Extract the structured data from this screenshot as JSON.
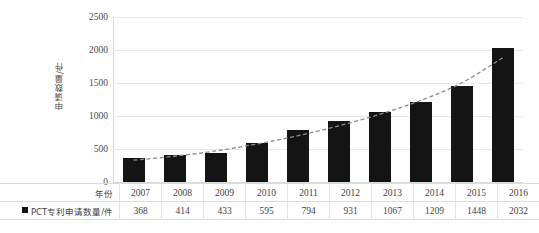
{
  "chart_data": {
    "type": "bar",
    "title": "",
    "subtitle": "",
    "xlabel": "年份",
    "ylabel": "申请数量/件",
    "categories": [
      "2007",
      "2008",
      "2009",
      "2010",
      "2011",
      "2012",
      "2013",
      "2014",
      "2015",
      "2016"
    ],
    "series": [
      {
        "name": "PCT专利申请数量/件",
        "values": [
          368,
          414,
          433,
          595,
          794,
          931,
          1067,
          1209,
          1448,
          2032
        ]
      },
      {
        "name": "trend-line",
        "style": "dashed",
        "color": "#8c8c8c",
        "values": [
          330,
          390,
          470,
          575,
          700,
          850,
          1025,
          1235,
          1500,
          1880
        ]
      }
    ],
    "ylim": [
      0,
      2500
    ],
    "yticks": [
      0,
      500,
      1000,
      1500,
      2000,
      2500
    ],
    "ytick_labels": [
      "0",
      "500",
      "1000",
      "1500",
      "2000",
      "2500"
    ],
    "grid": true,
    "legend_position": "table-row",
    "bar_color": "#141414",
    "gridline_color": "#e9e9e9"
  },
  "axis": {
    "y_title": "申请数量/件",
    "ticks": [
      {
        "label": "2500",
        "value": 2500
      },
      {
        "label": "2000",
        "value": 2000
      },
      {
        "label": "1500",
        "value": 1500
      },
      {
        "label": "1000",
        "value": 1000
      },
      {
        "label": "500",
        "value": 500
      },
      {
        "label": "0",
        "value": 0
      }
    ]
  },
  "table": {
    "year_row_label": "年份",
    "series_row_label": "PCT专利申请数量/件",
    "years": [
      "2007",
      "2008",
      "2009",
      "2010",
      "2011",
      "2012",
      "2013",
      "2014",
      "2015",
      "2016"
    ],
    "values": [
      "368",
      "414",
      "433",
      "595",
      "794",
      "931",
      "1067",
      "1209",
      "1448",
      "2032"
    ]
  }
}
